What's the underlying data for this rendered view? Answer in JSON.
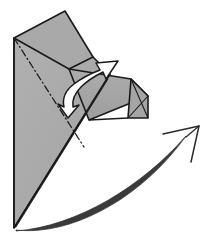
{
  "figure": {
    "kind": "origami-fold-diagram",
    "title": "Origami folding step diagram",
    "width": 207,
    "height": 242,
    "background_color": "#ffffff"
  },
  "colors": {
    "paper_fill": "#a8a8a8",
    "paper_fill_light": "#b0b0b0",
    "paper_fill_dark": "#9b9b9b",
    "outline": "#1a1a1a",
    "crease_line": "#1a1a1a",
    "white_arrow_fill": "#ffffff",
    "white_arrow_stroke": "#1a1a1a",
    "rotation_arrow_stroke": "#2b2b2b"
  },
  "shapes": {
    "upper_flap": {
      "name": "upper-triangular-flap",
      "points": "14,38 65,11 93,57 69,69"
    },
    "main_body": {
      "name": "main-paper-body",
      "points": "14,38 93,57 110,74 14,228"
    },
    "main_body_left": {
      "name": "main-paper-left-panel",
      "points": "14,38 14,228 84,147"
    },
    "folded_band": {
      "name": "folded-over-band",
      "points": "69,69 131,79 148,96 88,120"
    },
    "band_lower": {
      "name": "folded-band-lower-edge",
      "points": "88,120 148,96 148,118 128,118"
    },
    "right_tab": {
      "name": "right-small-tab",
      "points": "131,79 148,96 148,118 128,118"
    },
    "right_tab_fold": {
      "name": "right-tab-fold-edge",
      "points": "131,79 148,118"
    },
    "bottom_edge": {
      "name": "lower-diagonal-edge",
      "points": "14,228 110,74"
    }
  },
  "crease": {
    "name": "valley-crease-dash-dot",
    "from": "14,38",
    "to": "84,147",
    "style": "dash-dot"
  },
  "white_arrow": {
    "name": "fold-over-arrow",
    "label": "fold this flap over to the right",
    "tip": "115,62",
    "tail": "64,107"
  },
  "rotation_arrow": {
    "name": "rotation-arrow",
    "label": "rotate / turn model",
    "tip": "199,126",
    "tail": "16,230"
  }
}
